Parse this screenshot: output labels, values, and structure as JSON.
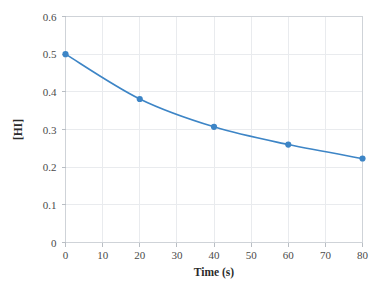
{
  "chart_data": {
    "type": "line",
    "title": "",
    "xlabel": "Time (s)",
    "ylabel": "[HI]",
    "x": [
      0,
      20,
      40,
      60,
      80
    ],
    "values": [
      0.5,
      0.381,
      0.307,
      0.26,
      0.223
    ],
    "series": [
      {
        "name": "[HI]",
        "x": [
          0,
          20,
          40,
          60,
          80
        ],
        "values": [
          0.5,
          0.381,
          0.307,
          0.26,
          0.223
        ]
      }
    ],
    "xlim": [
      0,
      80
    ],
    "ylim": [
      0,
      0.6
    ],
    "xticks": [
      0,
      10,
      20,
      30,
      40,
      50,
      60,
      70,
      80
    ],
    "xtick_labels": [
      "0",
      "10",
      "20",
      "30",
      "40",
      "50",
      "60",
      "70",
      "80"
    ],
    "yticks": [
      0,
      0.1,
      0.2,
      0.3,
      0.4,
      0.5,
      0.6
    ],
    "ytick_labels": [
      "0",
      "0.1",
      "0.2",
      "0.3",
      "0.4",
      "0.5",
      "0.6"
    ],
    "grid": true,
    "legend": false,
    "legend_position": "none",
    "marker": "circle",
    "colors": {
      "series": "#3d85c6",
      "marker": "#3d85c6",
      "grid": "#e9ebee",
      "frame": "#cfd3d8",
      "tick_text": "#4a4a4a",
      "title_text": "#2b2b2b",
      "background": "#ffffff"
    }
  }
}
